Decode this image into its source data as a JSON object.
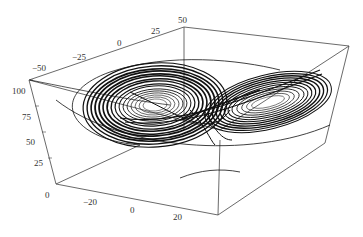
{
  "chart_data": {
    "type": "line",
    "subtype": "3d-parametric-curve",
    "title": "",
    "axes": {
      "x": {
        "label": "",
        "ticks": [
          "-20",
          "0",
          "20"
        ],
        "range": [
          -25,
          25
        ]
      },
      "y": {
        "label": "",
        "ticks": [
          "-50",
          "-25",
          "0",
          "25",
          "50"
        ],
        "range": [
          -60,
          50
        ]
      },
      "z": {
        "label": "",
        "ticks": [
          "0",
          "25",
          "50",
          "75",
          "100"
        ],
        "range": [
          0,
          110
        ]
      }
    },
    "lobes": [
      {
        "name": "left-lobe",
        "center_px": [
          155,
          105
        ],
        "rx_px": 70,
        "ry_px": 40
      },
      {
        "name": "right-lobe",
        "center_px": [
          263,
          103
        ],
        "rx_px": 62,
        "ry_px": 28
      }
    ],
    "grid": false,
    "legend": null,
    "box": true
  },
  "labels": {
    "y_ticks": [
      {
        "text": "-50",
        "x": 32,
        "y": 71
      },
      {
        "text": "-25",
        "x": 72,
        "y": 60
      },
      {
        "text": "0",
        "x": 117,
        "y": 46
      },
      {
        "text": "25",
        "x": 151,
        "y": 34
      },
      {
        "text": "50",
        "x": 178,
        "y": 23
      }
    ],
    "z_ticks": [
      {
        "text": "100",
        "x": 12,
        "y": 94
      },
      {
        "text": "75",
        "x": 22,
        "y": 120
      },
      {
        "text": "50",
        "x": 26,
        "y": 145
      },
      {
        "text": "25",
        "x": 34,
        "y": 166
      },
      {
        "text": "0",
        "x": 45,
        "y": 198
      }
    ],
    "x_ticks": [
      {
        "text": "-20",
        "x": 83,
        "y": 205
      },
      {
        "text": "0",
        "x": 130,
        "y": 213
      },
      {
        "text": "20",
        "x": 173,
        "y": 220
      }
    ]
  }
}
